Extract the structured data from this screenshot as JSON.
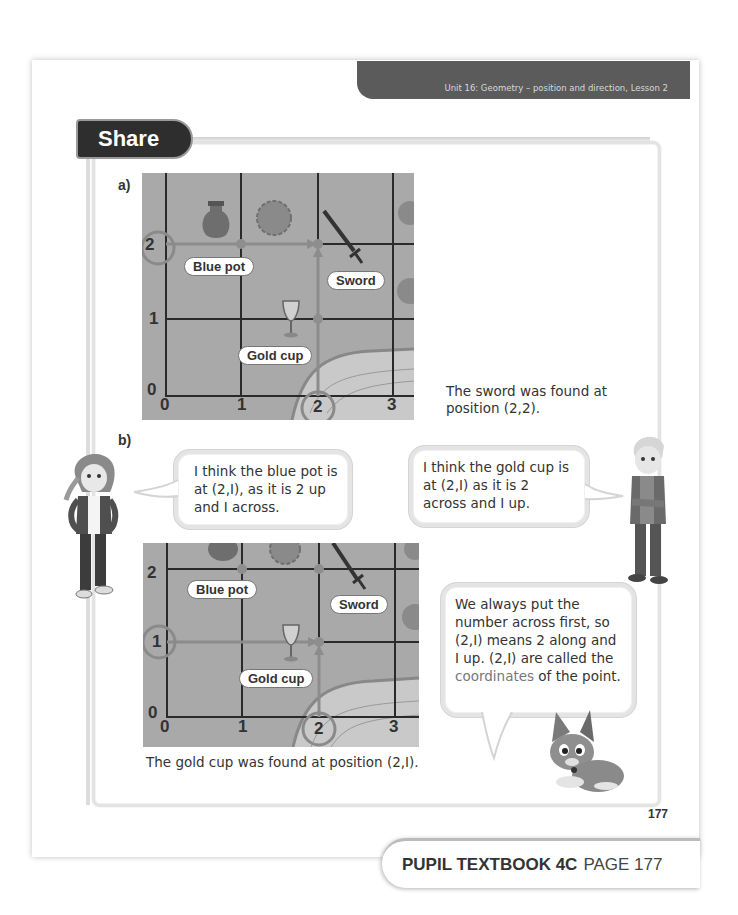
{
  "header": {
    "unit_banner": "Unit 16: Geometry – position and direction, Lesson 2"
  },
  "section": {
    "title": "Share"
  },
  "part_a": {
    "label": "a)",
    "map": {
      "x_ticks": [
        "0",
        "1",
        "2",
        "3"
      ],
      "y_ticks": [
        "0",
        "1",
        "2",
        "3"
      ],
      "highlighted_x": "2",
      "highlighted_y": "2",
      "tags": {
        "blue_pot": "Blue pot",
        "sword": "Sword",
        "gold_cup": "Gold cup"
      }
    },
    "caption": "The sword was found at position (2,2)."
  },
  "part_b": {
    "label": "b)",
    "bubble_girl": "I think the blue pot is at (2,I), as it is 2 up and I across.",
    "bubble_boy": "I think the gold cup is at (2,I) as it is 2 across and I up.",
    "bubble_dog_parts": {
      "before": "We always put the number across first, so (2,I) means 2 along and I up. (2,I) are called the ",
      "highlight": "coordinates",
      "after": " of the point."
    },
    "map": {
      "x_ticks": [
        "0",
        "1",
        "2",
        "3"
      ],
      "y_ticks": [
        "0",
        "1",
        "2"
      ],
      "highlighted_x": "2",
      "highlighted_y": "I",
      "tags": {
        "blue_pot": "Blue pot",
        "sword": "Sword",
        "gold_cup": "Gold cup"
      }
    },
    "caption": "The gold cup was found at position (2,I)."
  },
  "page_number": "177",
  "footer": {
    "book": "PUPIL TEXTBOOK 4C",
    "page": "PAGE 177"
  },
  "colors": {
    "banner": "#5b5b5b",
    "share_tab": "#2e2e2e",
    "map_bg": "#a9a9a9",
    "grid_line": "#2a2a2a",
    "highlight_ring": "#8a8a8a",
    "coordinates_word": "#777777"
  }
}
